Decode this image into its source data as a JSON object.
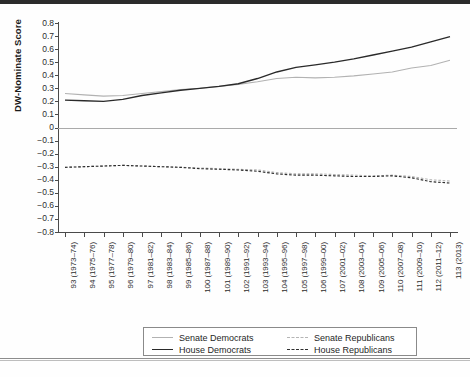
{
  "chart_data": {
    "type": "line",
    "title": "",
    "xlabel": "",
    "ylabel": "DW-Nominate Score",
    "ylim": [
      -0.8,
      0.8
    ],
    "ytick_step": 0.1,
    "grid": false,
    "legend_position": "bottom",
    "yticks": [
      "0.8",
      "0.7",
      "0.6",
      "0.5",
      "0.4",
      "0.3",
      "0.2",
      "0.1",
      "0",
      "−0.1",
      "−0.2",
      "−0.3",
      "−0.4",
      "−0.5",
      "−0.6",
      "−0.7",
      "−0.8"
    ],
    "categories": [
      "93 (1973–74)",
      "94 (1975–76)",
      "95 (1977–78)",
      "96 (1979–80)",
      "97 (1981–82)",
      "98 (1983–84)",
      "99 (1985–86)",
      "100 (1987–88)",
      "101 (1989–90)",
      "102 (1991–92)",
      "103 (1993–94)",
      "104 (1995–96)",
      "105 (1997–98)",
      "106 (1999–00)",
      "107 (2001–02)",
      "108 (2003–04)",
      "109 (2005–06)",
      "110 (2007–08)",
      "111 (2009–10)",
      "112 (2011–12)",
      "113 (2013)"
    ],
    "series": [
      {
        "name": "Senate Democrats",
        "style": "solid",
        "color": "#b2b2b2",
        "values": [
          0.26,
          0.25,
          0.24,
          0.245,
          0.26,
          0.275,
          0.29,
          0.3,
          0.315,
          0.33,
          0.35,
          0.375,
          0.385,
          0.38,
          0.385,
          0.395,
          0.41,
          0.425,
          0.455,
          0.475,
          0.515
        ]
      },
      {
        "name": "House Democrats",
        "style": "solid",
        "color": "#2a2a2a",
        "values": [
          0.21,
          0.205,
          0.2,
          0.215,
          0.245,
          0.265,
          0.285,
          0.3,
          0.315,
          0.335,
          0.375,
          0.425,
          0.46,
          0.48,
          0.5,
          0.525,
          0.555,
          0.585,
          0.615,
          0.655,
          0.695
        ]
      },
      {
        "name": "Senate Republicans",
        "style": "dashed",
        "color": "#b5b5b5",
        "values": [
          -0.305,
          -0.3,
          -0.295,
          -0.29,
          -0.295,
          -0.3,
          -0.305,
          -0.31,
          -0.315,
          -0.32,
          -0.325,
          -0.345,
          -0.355,
          -0.355,
          -0.36,
          -0.365,
          -0.37,
          -0.365,
          -0.375,
          -0.4,
          -0.41
        ]
      },
      {
        "name": "House Republicans",
        "style": "dashed",
        "color": "#2f2f2f",
        "values": [
          -0.305,
          -0.3,
          -0.295,
          -0.29,
          -0.295,
          -0.3,
          -0.305,
          -0.315,
          -0.32,
          -0.325,
          -0.335,
          -0.355,
          -0.365,
          -0.365,
          -0.37,
          -0.375,
          -0.375,
          -0.37,
          -0.385,
          -0.415,
          -0.425
        ]
      }
    ]
  },
  "legend": {
    "items": [
      {
        "label": "Senate Democrats",
        "swatch": "solid-light"
      },
      {
        "label": "Senate Republicans",
        "swatch": "dash-light"
      },
      {
        "label": "House Democrats",
        "swatch": "solid-dark"
      },
      {
        "label": "House Republicans",
        "swatch": "dash-dark"
      }
    ]
  }
}
